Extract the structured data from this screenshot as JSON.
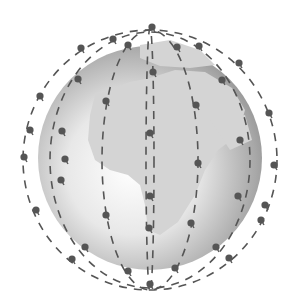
{
  "figure": {
    "colors": {
      "background": "#ffffff",
      "globe_light": "#f4f4f4",
      "globe_dark": "#8c8c8c",
      "land": "#d3d3d3",
      "orbit": "#555555",
      "satellite": "#555555"
    },
    "globe": {
      "cx": 150,
      "cy": 158,
      "r": 112
    },
    "orbits": [
      {
        "cx": 150,
        "cy": 160,
        "rx": 127,
        "ry": 130
      },
      {
        "cx": 150,
        "cy": 160,
        "rx": 100,
        "ry": 128
      },
      {
        "cx": 150,
        "cy": 160,
        "rx": 48,
        "ry": 130
      },
      {
        "cx": 150,
        "cy": 160,
        "rx": 4,
        "ry": 132
      }
    ],
    "satellites": [
      [
        152,
        27
      ],
      [
        113,
        39
      ],
      [
        128,
        45
      ],
      [
        81,
        48
      ],
      [
        177,
        47
      ],
      [
        199,
        46
      ],
      [
        239,
        63
      ],
      [
        222,
        80
      ],
      [
        40,
        96
      ],
      [
        78,
        79
      ],
      [
        106,
        101
      ],
      [
        153,
        72
      ],
      [
        196,
        105
      ],
      [
        269,
        113
      ],
      [
        30,
        130
      ],
      [
        62,
        131
      ],
      [
        150,
        133
      ],
      [
        240,
        140
      ],
      [
        274,
        165
      ],
      [
        24,
        157
      ],
      [
        61,
        180
      ],
      [
        198,
        163
      ],
      [
        106,
        215
      ],
      [
        191,
        223
      ],
      [
        150,
        196
      ],
      [
        36,
        210
      ],
      [
        85,
        247
      ],
      [
        149,
        228
      ],
      [
        261,
        220
      ],
      [
        216,
        247
      ],
      [
        128,
        271
      ],
      [
        175,
        268
      ],
      [
        229,
        258
      ],
      [
        150,
        284
      ],
      [
        72,
        259
      ],
      [
        265,
        205
      ],
      [
        65,
        159
      ],
      [
        238,
        196
      ]
    ]
  }
}
